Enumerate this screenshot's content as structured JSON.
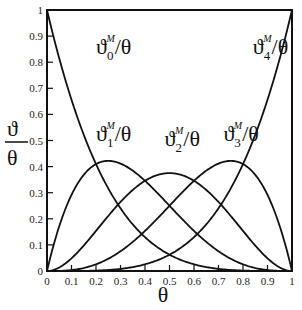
{
  "chart_data": {
    "type": "line",
    "title": "",
    "xlabel": "θ",
    "ylabel": "ϑ/θ",
    "xlim": [
      0,
      1
    ],
    "ylim": [
      0,
      1
    ],
    "grid": false,
    "x_ticks": [
      "0",
      "0.1",
      "0.2",
      "0.3",
      "0.4",
      "0.5",
      "0.6",
      "0.7",
      "0.8",
      "0.9",
      "1"
    ],
    "y_ticks": [
      "0",
      "0.1",
      "0.2",
      "0.3",
      "0.4",
      "0.5",
      "0.6",
      "0.7",
      "0.8",
      "0.9",
      "1"
    ],
    "x": [
      0,
      0.1,
      0.2,
      0.25,
      0.3,
      0.4,
      0.5,
      0.6,
      0.7,
      0.75,
      0.8,
      0.9,
      1
    ],
    "series": [
      {
        "name": "ϑ0M/θ",
        "values": [
          1,
          0.656,
          0.41,
          0.316,
          0.24,
          0.13,
          0.0625,
          0.026,
          0.008,
          0.004,
          0.002,
          0.0001,
          0
        ]
      },
      {
        "name": "ϑ1M/θ",
        "values": [
          0,
          0.292,
          0.41,
          0.422,
          0.412,
          0.346,
          0.25,
          0.154,
          0.076,
          0.047,
          0.026,
          0.004,
          0
        ]
      },
      {
        "name": "ϑ2M/θ",
        "values": [
          0,
          0.049,
          0.154,
          0.211,
          0.265,
          0.346,
          0.375,
          0.346,
          0.265,
          0.211,
          0.154,
          0.049,
          0
        ]
      },
      {
        "name": "ϑ3M/θ",
        "values": [
          0,
          0.004,
          0.026,
          0.047,
          0.076,
          0.154,
          0.25,
          0.346,
          0.412,
          0.422,
          0.41,
          0.292,
          0
        ]
      },
      {
        "name": "ϑ4M/θ",
        "values": [
          0,
          0.0001,
          0.002,
          0.004,
          0.008,
          0.026,
          0.0625,
          0.13,
          0.24,
          0.316,
          0.41,
          0.656,
          1
        ]
      }
    ],
    "annotations": [
      {
        "text": "ϑ0M/θ",
        "x": 0.2,
        "y": 0.83
      },
      {
        "text": "ϑ1M/θ",
        "x": 0.2,
        "y": 0.5
      },
      {
        "text": "ϑ2M/θ",
        "x": 0.48,
        "y": 0.48
      },
      {
        "text": "ϑ3M/θ",
        "x": 0.72,
        "y": 0.5
      },
      {
        "text": "ϑ4M/θ",
        "x": 0.84,
        "y": 0.83
      }
    ]
  },
  "labels": {
    "x_axis": "θ",
    "y_axis_num": "ϑ",
    "y_axis_den": "θ",
    "theta_sym": "ϑ",
    "sup": "M",
    "slash_theta": "/θ",
    "idx": [
      "0",
      "1",
      "2",
      "3",
      "4"
    ]
  }
}
